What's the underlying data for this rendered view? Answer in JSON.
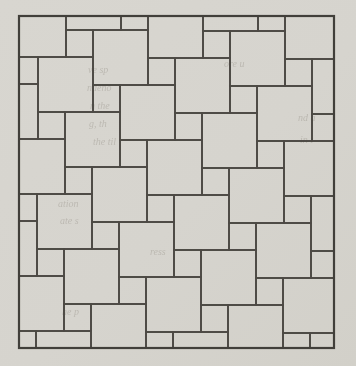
{
  "canvas": {
    "width": 356,
    "height": 366,
    "paper_color": "#d6d4ce"
  },
  "figure": {
    "kind": "pinwheel-square-tiling",
    "border": {
      "x": 19,
      "y": 16,
      "width": 315,
      "height": 332,
      "stroke_width": 2.2,
      "color": "#413f3a"
    },
    "tiling": {
      "type": "pythagorean-pinwheel",
      "large_square": 55,
      "small_square": 27,
      "origin_x": 147,
      "origin_y": 140,
      "i_min": -7,
      "i_max": 7,
      "j_min": -7,
      "j_max": 7,
      "line_width": 1.7,
      "line_color": "#4c4944",
      "tile_fill": "none"
    },
    "bleed_text": {
      "color": "#98938a",
      "opacity": 0.42,
      "font_size": 10,
      "fragments": [
        {
          "text": "ve sp",
          "x": 88,
          "y": 64
        },
        {
          "text": "ndeno",
          "x": 87,
          "y": 82
        },
        {
          "text": "n the",
          "x": 90,
          "y": 100
        },
        {
          "text": "g, th",
          "x": 89,
          "y": 118
        },
        {
          "text": "the til",
          "x": 93,
          "y": 136
        },
        {
          "text": "ore u",
          "x": 224,
          "y": 58
        },
        {
          "text": "nd a",
          "x": 298,
          "y": 112
        },
        {
          "text": "in t",
          "x": 300,
          "y": 134
        },
        {
          "text": "ation",
          "x": 58,
          "y": 198
        },
        {
          "text": "ate s",
          "x": 60,
          "y": 215
        },
        {
          "text": "ress",
          "x": 150,
          "y": 246
        },
        {
          "text": "he p",
          "x": 62,
          "y": 306
        }
      ]
    }
  }
}
